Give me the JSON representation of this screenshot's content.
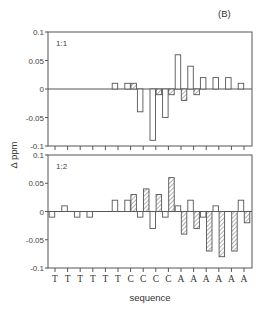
{
  "figure": {
    "panel_tag": "(B)",
    "ylabel": "Δ ppm",
    "xlabel": "sequence"
  },
  "chart_data": [
    {
      "type": "bar",
      "title": "1:1",
      "categories": [
        "T",
        "T",
        "T",
        "T",
        "T",
        "T",
        "C",
        "C",
        "C",
        "C",
        "A",
        "A",
        "A",
        "A",
        "A",
        "A"
      ],
      "series": [
        {
          "name": "open",
          "style": "open",
          "values": [
            0,
            0,
            0,
            0,
            0,
            0.01,
            0.01,
            -0.04,
            -0.09,
            -0.05,
            0.06,
            0.04,
            0.02,
            0.02,
            0.02,
            0.01
          ]
        },
        {
          "name": "hatched",
          "style": "hatched",
          "values": [
            0,
            0,
            0,
            0,
            0,
            0,
            0.01,
            0,
            -0.01,
            -0.01,
            -0.02,
            -0.01,
            0,
            0,
            0,
            0
          ]
        }
      ],
      "xlabel": "",
      "ylabel": "Δ ppm",
      "ylim": [
        -0.1,
        0.1
      ],
      "yticks": [
        0.1,
        0.05,
        0,
        -0.05,
        -0.1
      ],
      "ytick_labels": [
        "0.1",
        "0.05",
        "0",
        "-0.05",
        "-0.1"
      ],
      "grid": false,
      "legend": null
    },
    {
      "type": "bar",
      "title": "1:2",
      "categories": [
        "T",
        "T",
        "T",
        "T",
        "T",
        "T",
        "C",
        "C",
        "C",
        "C",
        "A",
        "A",
        "A",
        "A",
        "A",
        "A"
      ],
      "series": [
        {
          "name": "open",
          "style": "open",
          "values": [
            -0.01,
            0.01,
            -0.01,
            -0.01,
            0,
            0.02,
            0.02,
            -0.01,
            -0.03,
            -0.01,
            0.01,
            0.02,
            -0.01,
            0.01,
            0,
            0.02
          ]
        },
        {
          "name": "hatched",
          "style": "hatched",
          "values": [
            0,
            0,
            0,
            0,
            0,
            0,
            0.03,
            0.04,
            0.03,
            0.06,
            -0.04,
            -0.03,
            -0.07,
            -0.08,
            -0.07,
            -0.02
          ]
        }
      ],
      "xlabel": "sequence",
      "ylabel": "Δ ppm",
      "ylim": [
        -0.1,
        0.1
      ],
      "yticks": [
        0.1,
        0.05,
        0,
        -0.05,
        -0.1
      ],
      "ytick_labels": [
        "0.1",
        "0.05",
        "0",
        "-0.05",
        "-0.1"
      ],
      "grid": false,
      "legend": null
    }
  ]
}
